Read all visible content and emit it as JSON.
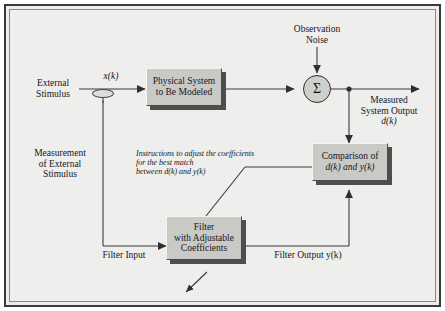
{
  "figure": {
    "type": "block-diagram",
    "background_color": "#eeeeec",
    "frame_color": "#3a3a3a",
    "block_fill": "#c9c9c6",
    "line_color": "#3a3a3f"
  },
  "blocks": [
    {
      "id": "physical-system",
      "label_line1": "Physical System",
      "label_line2": "to Be Modeled"
    },
    {
      "id": "comparison",
      "label_line1": "Comparison of",
      "label_line2": "d(k) and y(k)"
    },
    {
      "id": "filter",
      "label_line1": "Filter",
      "label_line2": "with Adjustable",
      "label_line3": "Coefficients"
    }
  ],
  "summing_junction": {
    "id": "summing-junction",
    "symbol": "Σ"
  },
  "labels": {
    "external_stimulus_line1": "External",
    "external_stimulus_line2": "Stimulus",
    "x_of_k": "x(k)",
    "observation_noise_line1": "Observation",
    "observation_noise_line2": "Noise",
    "measured_output_line1": "Measured",
    "measured_output_line2": "System Output",
    "measured_output_line3": "d(k)",
    "measurement_line1": "Measurement",
    "measurement_line2": "of External",
    "measurement_line3": "Stimulus",
    "instructions_line1": "Instructions to adjust the coefficients",
    "instructions_line2": "for the best match",
    "instructions_line3": "between d(k) and y(k)",
    "filter_input": "Filter Input",
    "filter_output": "Filter Output y(k)"
  }
}
